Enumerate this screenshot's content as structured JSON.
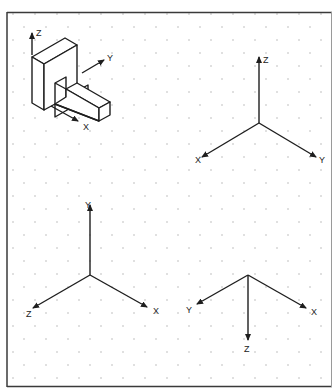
{
  "header": {
    "partial_title": ""
  },
  "colors": {
    "background": "#ffffff",
    "frame": "#3a3a3a",
    "frame_right": "#9a9a9a",
    "grid_dot": "#b8b8b8",
    "line": "#1e1e1e",
    "header_text": "#8fb6d8"
  },
  "grid": {
    "type": "isometric-dot",
    "dx": 22,
    "dy": 13
  },
  "object_view": {
    "description": "isometric view of L-shaped block with arm",
    "axes": {
      "z_label": "Z",
      "y_label": "Y",
      "x_label": "X"
    }
  },
  "triads": [
    {
      "name": "top-right",
      "labels": {
        "up": "Z",
        "left": "X",
        "right": "Y"
      }
    },
    {
      "name": "bottom-left",
      "labels": {
        "up": "Y",
        "left": "Z",
        "right": "X"
      }
    },
    {
      "name": "bottom-right",
      "labels": {
        "down": "Z",
        "left": "Y",
        "right": "X"
      }
    }
  ]
}
